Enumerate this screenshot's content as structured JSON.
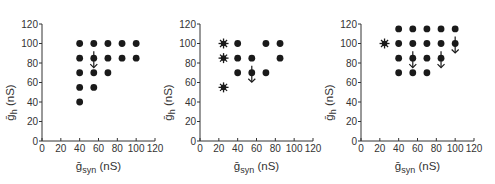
{
  "chart_data": [
    {
      "type": "scatter",
      "panel": 1,
      "title": "",
      "xlabel": "ḡsyn (nS)",
      "ylabel": "ḡh (nS)",
      "xlim": [
        0,
        120
      ],
      "ylim": [
        0,
        120
      ],
      "xticks": [
        0,
        20,
        40,
        60,
        80,
        100,
        120
      ],
      "yticks": [
        0,
        20,
        40,
        60,
        80,
        100,
        120
      ],
      "grid": false,
      "series": [
        {
          "name": "dot",
          "marker": "circle",
          "points": [
            [
              40,
              100
            ],
            [
              55,
              100
            ],
            [
              70,
              100
            ],
            [
              85,
              100
            ],
            [
              100,
              100
            ],
            [
              40,
              85
            ],
            [
              55,
              85
            ],
            [
              70,
              85
            ],
            [
              85,
              85
            ],
            [
              100,
              85
            ],
            [
              40,
              70
            ],
            [
              55,
              70
            ],
            [
              70,
              70
            ],
            [
              40,
              55
            ],
            [
              55,
              55
            ],
            [
              40,
              40
            ]
          ]
        },
        {
          "name": "star",
          "marker": "star",
          "points": []
        },
        {
          "name": "down-arrow",
          "marker": "arrow-down",
          "points": [
            [
              55,
              85
            ]
          ]
        }
      ]
    },
    {
      "type": "scatter",
      "panel": 2,
      "title": "",
      "xlabel": "ḡsyn (nS)",
      "ylabel": "ḡh (nS)",
      "xlim": [
        0,
        120
      ],
      "ylim": [
        0,
        120
      ],
      "xticks": [
        0,
        20,
        40,
        60,
        80,
        100,
        120
      ],
      "yticks": [
        0,
        20,
        40,
        60,
        80,
        100,
        120
      ],
      "grid": false,
      "series": [
        {
          "name": "dot",
          "marker": "circle",
          "points": [
            [
              40,
              100
            ],
            [
              70,
              100
            ],
            [
              85,
              100
            ],
            [
              40,
              85
            ],
            [
              55,
              85
            ],
            [
              85,
              85
            ],
            [
              40,
              70
            ],
            [
              55,
              70
            ],
            [
              70,
              70
            ]
          ]
        },
        {
          "name": "star",
          "marker": "star",
          "points": [
            [
              25,
              100
            ],
            [
              25,
              85
            ],
            [
              25,
              55
            ]
          ]
        },
        {
          "name": "down-arrow",
          "marker": "arrow-down",
          "points": [
            [
              55,
              70
            ]
          ]
        }
      ]
    },
    {
      "type": "scatter",
      "panel": 3,
      "title": "",
      "xlabel": "ḡsyn (nS)",
      "ylabel": "ḡh (nS)",
      "xlim": [
        0,
        120
      ],
      "ylim": [
        0,
        120
      ],
      "xticks": [
        0,
        20,
        40,
        60,
        80,
        100,
        120
      ],
      "yticks": [
        0,
        20,
        40,
        60,
        80,
        100,
        120
      ],
      "grid": false,
      "series": [
        {
          "name": "dot",
          "marker": "circle",
          "points": [
            [
              40,
              115
            ],
            [
              55,
              115
            ],
            [
              70,
              115
            ],
            [
              85,
              115
            ],
            [
              100,
              115
            ],
            [
              40,
              100
            ],
            [
              55,
              100
            ],
            [
              70,
              100
            ],
            [
              85,
              100
            ],
            [
              100,
              100
            ],
            [
              40,
              85
            ],
            [
              55,
              85
            ],
            [
              70,
              85
            ],
            [
              85,
              85
            ],
            [
              40,
              70
            ],
            [
              55,
              70
            ],
            [
              70,
              70
            ]
          ]
        },
        {
          "name": "star",
          "marker": "star",
          "points": [
            [
              25,
              100
            ]
          ]
        },
        {
          "name": "down-arrow",
          "marker": "arrow-down",
          "points": [
            [
              100,
              100
            ],
            [
              55,
              85
            ],
            [
              85,
              85
            ]
          ]
        }
      ]
    }
  ],
  "labels": {
    "x_main": "g",
    "x_sub": "syn",
    "x_unit": " (nS)",
    "y_main": "g",
    "y_sub": "h",
    "y_unit": " (nS)"
  },
  "colors": {
    "marker": "#1a1a1a",
    "axis": "#333333"
  }
}
